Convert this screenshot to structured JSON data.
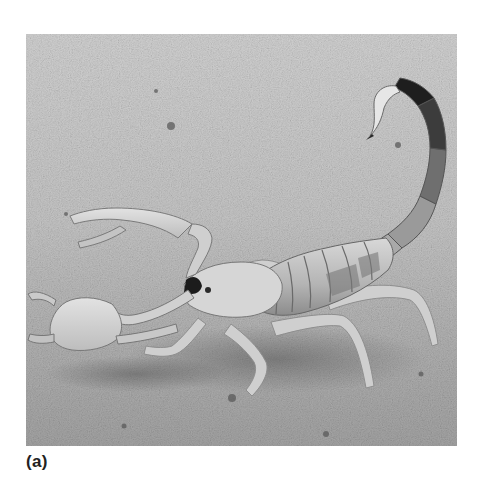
{
  "figure": {
    "panel_label": "(a)",
    "color_mode": "grayscale",
    "colors": {
      "sand_light": "#d4d4d4",
      "sand_mid": "#b8b8b8",
      "sand_dark": "#8a8a8a",
      "body_light": "#dedede",
      "body_mid": "#bdbdbd",
      "body_dark": "#6e6e6e",
      "stinger_dark": "#1e1e1e",
      "caption_text": "#222222"
    }
  }
}
